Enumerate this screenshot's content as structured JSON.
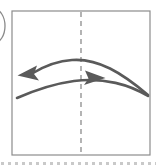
{
  "figure": {
    "label": "diagram-panel",
    "panel_tag": "",
    "panel_tag_visible_fragment": "circled-label-clipped",
    "background_color": "#ffffff",
    "frame": {
      "name": "panel-border",
      "x": 12,
      "y": 11,
      "width": 138,
      "height": 144,
      "stroke_color": "#8c8c8c",
      "stroke_width": 1.2,
      "fill": "#ffffff"
    },
    "centerline": {
      "name": "vertical-dashed-centerline",
      "x": 81,
      "y_top": 12,
      "y_bottom": 154,
      "stroke_color": "#8c8c8c",
      "stroke_width": 1.3,
      "dash_pattern": "5 4",
      "orientation": "vertical"
    },
    "clipped_label": {
      "name": "clipped-circle-label",
      "cx": -6,
      "cy": 26,
      "rx": 11,
      "ry": 17,
      "stroke_color": "#8a8a8a",
      "stroke_width": 1.3
    },
    "arrows": [
      {
        "name": "upper-curve-left-arrow",
        "direction": "left",
        "description": "Upper curved arc sweeping from lower-right to upper-left, arrowhead pointing left",
        "stroke_color": "#5a5a5a",
        "stroke_width": 2.6,
        "start": [
          148,
          95
        ],
        "control": [
          88,
          56
        ],
        "end": [
          34,
          73
        ],
        "head_tip": [
          18,
          75
        ],
        "head_color": "#5a5a5a"
      },
      {
        "name": "lower-curve-right-arrow",
        "direction": "right",
        "description": "Lower curved arc sweeping from lower-left upward to the right, arrowhead pointing right",
        "stroke_color": "#5a5a5a",
        "stroke_width": 2.6,
        "start": [
          17,
          98
        ],
        "control": [
          78,
          84
        ],
        "end": [
          148,
          96
        ],
        "head_tip": [
          105,
          78
        ],
        "head_color": "#5a5a5a"
      }
    ],
    "bottom_rule": {
      "name": "dotted-separator",
      "y": 163,
      "x_start": 1,
      "x_end": 156,
      "dot_color": "#c9c9c9",
      "dot_size": 3,
      "dot_gap": 4,
      "dot_count": 23
    }
  }
}
